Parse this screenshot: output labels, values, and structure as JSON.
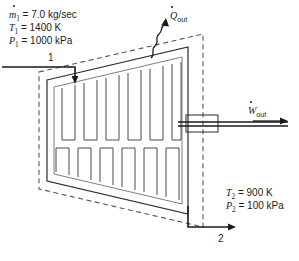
{
  "figure": {
    "background_color": "#ffffff",
    "line_color": "#2b2b2b",
    "dashed_color": "#555555"
  },
  "inlet": {
    "station_number": "1",
    "mass_flow_symbol": "m",
    "mass_flow_subscript": "1",
    "mass_flow_value": " = 7.0 kg/sec",
    "temperature_symbol": "T",
    "temperature_subscript": "1",
    "temperature_value": " = 1400 K",
    "pressure_symbol": "P",
    "pressure_subscript": "1",
    "pressure_value": " = 1000 kPa"
  },
  "outlet": {
    "station_number": "2",
    "temperature_symbol": "T",
    "temperature_subscript": "2",
    "temperature_value": " = 900 K",
    "pressure_symbol": "P",
    "pressure_subscript": "2",
    "pressure_value": " = 100 kPa"
  },
  "heat": {
    "symbol": "Q",
    "subscript": "out"
  },
  "work": {
    "symbol": "W",
    "subscript": "out"
  }
}
